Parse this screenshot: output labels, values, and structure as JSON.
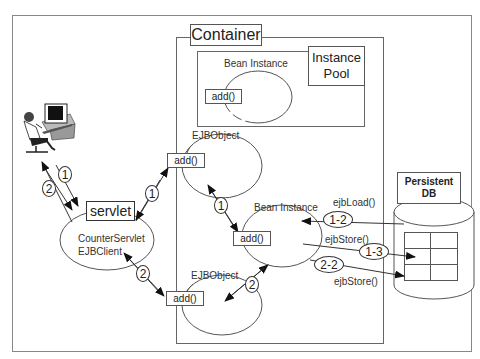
{
  "diagram": {
    "container_label": "Container",
    "instance_pool_label": "Instance\nPool",
    "pool_bean_label": "Bean Instance",
    "pool_bean_method": "add()",
    "ejbobject_top_label": "EJBObject",
    "ejbobject_top_method": "add()",
    "ejbobject_bottom_label": "EJBObject",
    "ejbobject_bottom_method": "add()",
    "bean_instance_label": "Bean Instance",
    "bean_instance_method": "add()",
    "servlet_label": "servlet",
    "servlet_client_line1": "CounterServlet",
    "servlet_client_line2": "EJBClient",
    "db_label_line1": "Persistent",
    "db_label_line2": "DB",
    "client_icon": "user-at-computer-icon",
    "steps": {
      "user_1": "1",
      "user_2": "2",
      "servlet_ejb_1": "1",
      "servlet_ejb_2": "2",
      "ejb_bean_1": "1",
      "ejb_bean_2": "2",
      "load_1_2": "1-2",
      "store_1_3": "1-3",
      "store_2_2": "2-2"
    },
    "calls": {
      "ejb_load": "ejbLoad()",
      "ejb_store_1": "ejbStore()",
      "ejb_store_2": "ejbStore()"
    }
  }
}
